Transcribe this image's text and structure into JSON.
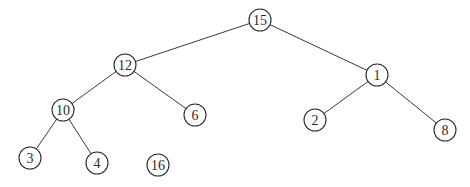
{
  "diagram": {
    "type": "binary-tree",
    "node_radius": 11,
    "nodes": [
      {
        "id": "n15",
        "label": "15",
        "x": 260,
        "y": 20
      },
      {
        "id": "n12",
        "label": "12",
        "x": 125,
        "y": 65
      },
      {
        "id": "n1",
        "label": "1",
        "x": 377,
        "y": 75
      },
      {
        "id": "n10",
        "label": "10",
        "x": 63,
        "y": 110
      },
      {
        "id": "n6",
        "label": "6",
        "x": 195,
        "y": 115
      },
      {
        "id": "n2",
        "label": "2",
        "x": 315,
        "y": 120
      },
      {
        "id": "n8",
        "label": "8",
        "x": 445,
        "y": 130
      },
      {
        "id": "n3",
        "label": "3",
        "x": 30,
        "y": 158
      },
      {
        "id": "n4",
        "label": "4",
        "x": 97,
        "y": 163
      },
      {
        "id": "n16",
        "label": "16",
        "x": 158,
        "y": 165
      }
    ],
    "edges": [
      {
        "from": "n15",
        "to": "n12"
      },
      {
        "from": "n15",
        "to": "n1"
      },
      {
        "from": "n12",
        "to": "n10"
      },
      {
        "from": "n12",
        "to": "n6"
      },
      {
        "from": "n1",
        "to": "n2"
      },
      {
        "from": "n1",
        "to": "n8"
      },
      {
        "from": "n10",
        "to": "n3"
      },
      {
        "from": "n10",
        "to": "n4"
      }
    ],
    "colors": {
      "background": "#ffffff",
      "stroke": "#2a2a2a",
      "text": "#2a2a2a"
    }
  }
}
